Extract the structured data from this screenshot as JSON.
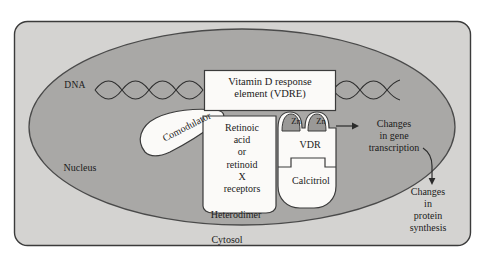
{
  "figure": {
    "title_implicit": "Vitamin D receptor binding at the vitamin D response element",
    "compartments": {
      "outer_cell_label": "Cytosol",
      "nucleus_label": "Nucleus"
    },
    "dna": {
      "label": "DNA"
    },
    "vdre_box": {
      "line1": "Vitamin D response",
      "line2": "element (VDRE)",
      "full_text": "Vitamin D response element (VDRE)"
    },
    "comodulator": {
      "label": "Comodulator"
    },
    "receptor_box": {
      "lines": [
        "Retinoic",
        "acid",
        "or",
        "retinoid",
        "X",
        "receptors"
      ],
      "full_text": "Retinoic acid or retinoid X receptors"
    },
    "vdr": {
      "label": "VDR",
      "ligand_label": "Calcitriol",
      "zinc_fingers": [
        "Zn",
        "Zn"
      ]
    },
    "dimer": {
      "label": "Heterodimer"
    },
    "outputs": [
      {
        "id": "gene-transcription",
        "lines": [
          "Changes",
          "in gene",
          "transcription"
        ],
        "full_text": "Changes in gene transcription"
      },
      {
        "id": "protein-synthesis",
        "lines": [
          "Changes",
          "in",
          "protein",
          "synthesis"
        ],
        "full_text": "Changes in protein synthesis"
      }
    ],
    "colors": {
      "page_background": "#ffffff",
      "cytosol_fill": "#d4d3d1",
      "nucleus_fill": "#a9a8a6",
      "protein_fill": "#fbfaf8",
      "zinc_finger_fill": "#9a9997",
      "border_stroke": "#3b3b3b",
      "text": "#1b1b1b"
    }
  }
}
